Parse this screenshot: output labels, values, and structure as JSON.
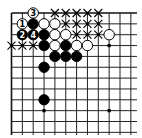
{
  "board": {
    "title": "Go problem diagram",
    "visible_columns": 12,
    "visible_rows": 12,
    "origin_x": 11.5,
    "origin_y": 13,
    "spacing": 10.85,
    "edges": [
      "top",
      "left"
    ],
    "colors": {
      "background": "#ffffff",
      "lines": "#222222",
      "black_stone": "#000000",
      "white_stone": "#ffffff"
    },
    "star_points": [
      {
        "col": 3,
        "row": 3
      },
      {
        "col": 9,
        "row": 3
      },
      {
        "col": 3,
        "row": 9
      },
      {
        "col": 9,
        "row": 9
      }
    ],
    "stones": [
      {
        "col": 2,
        "row": 0,
        "color": "white",
        "label": "3"
      },
      {
        "col": 1,
        "row": 1,
        "color": "white",
        "label": "1"
      },
      {
        "col": 2,
        "row": 1,
        "color": "black",
        "label": ""
      },
      {
        "col": 3,
        "row": 1,
        "color": "white",
        "label": ""
      },
      {
        "col": 4,
        "row": 1,
        "color": "white",
        "label": ""
      },
      {
        "col": 1,
        "row": 2,
        "color": "black",
        "label": "2"
      },
      {
        "col": 2,
        "row": 2,
        "color": "black",
        "label": "4"
      },
      {
        "col": 3,
        "row": 2,
        "color": "black",
        "label": ""
      },
      {
        "col": 4,
        "row": 2,
        "color": "white",
        "label": ""
      },
      {
        "col": 5,
        "row": 2,
        "color": "white",
        "label": ""
      },
      {
        "col": 9,
        "row": 2,
        "color": "white",
        "label": ""
      },
      {
        "col": 3,
        "row": 3,
        "color": "black",
        "label": ""
      },
      {
        "col": 4,
        "row": 3,
        "color": "white",
        "label": ""
      },
      {
        "col": 5,
        "row": 3,
        "color": "black",
        "label": ""
      },
      {
        "col": 6,
        "row": 3,
        "color": "white",
        "label": ""
      },
      {
        "col": 7,
        "row": 3,
        "color": "white",
        "label": ""
      },
      {
        "col": 4,
        "row": 4,
        "color": "black",
        "label": ""
      },
      {
        "col": 5,
        "row": 4,
        "color": "black",
        "label": ""
      },
      {
        "col": 6,
        "row": 4,
        "color": "black",
        "label": ""
      },
      {
        "col": 3,
        "row": 5,
        "color": "black",
        "label": ""
      },
      {
        "col": 3,
        "row": 8,
        "color": "black",
        "label": ""
      }
    ],
    "x_marks": [
      {
        "col": 4,
        "row": 0
      },
      {
        "col": 5,
        "row": 0
      },
      {
        "col": 6,
        "row": 0
      },
      {
        "col": 7,
        "row": 0
      },
      {
        "col": 8,
        "row": 0
      },
      {
        "col": 5,
        "row": 1
      },
      {
        "col": 6,
        "row": 1
      },
      {
        "col": 7,
        "row": 1
      },
      {
        "col": 8,
        "row": 1
      },
      {
        "col": 6,
        "row": 2
      },
      {
        "col": 7,
        "row": 2
      },
      {
        "col": 8,
        "row": 2
      },
      {
        "col": 0,
        "row": 3
      },
      {
        "col": 1,
        "row": 3
      },
      {
        "col": 2,
        "row": 3
      }
    ]
  }
}
